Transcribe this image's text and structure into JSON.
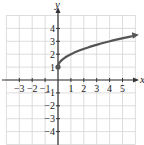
{
  "chart_data": {
    "type": "line",
    "title": "",
    "function": "y = sqrt(x) + 1",
    "xlabel": "x",
    "ylabel": "y",
    "xlim": [
      -4,
      6
    ],
    "ylim": [
      -5,
      5
    ],
    "grid": true,
    "x_ticks": [
      "-3",
      "-2",
      "-1",
      "1",
      "2",
      "3",
      "4",
      "5"
    ],
    "y_ticks": [
      "4",
      "3",
      "2",
      "1",
      "-1",
      "-2",
      "-3",
      "-4"
    ],
    "series": [
      {
        "name": "y = sqrt(x) + 1",
        "x": [
          0,
          0.25,
          1,
          2,
          3,
          4,
          5,
          6
        ],
        "y": [
          1,
          1.5,
          2,
          2.41,
          2.73,
          3,
          3.24,
          3.45
        ],
        "start_point": [
          0,
          1
        ],
        "start_marker": "closed-dot",
        "end_marker": "arrow"
      }
    ],
    "color": "#555555"
  }
}
